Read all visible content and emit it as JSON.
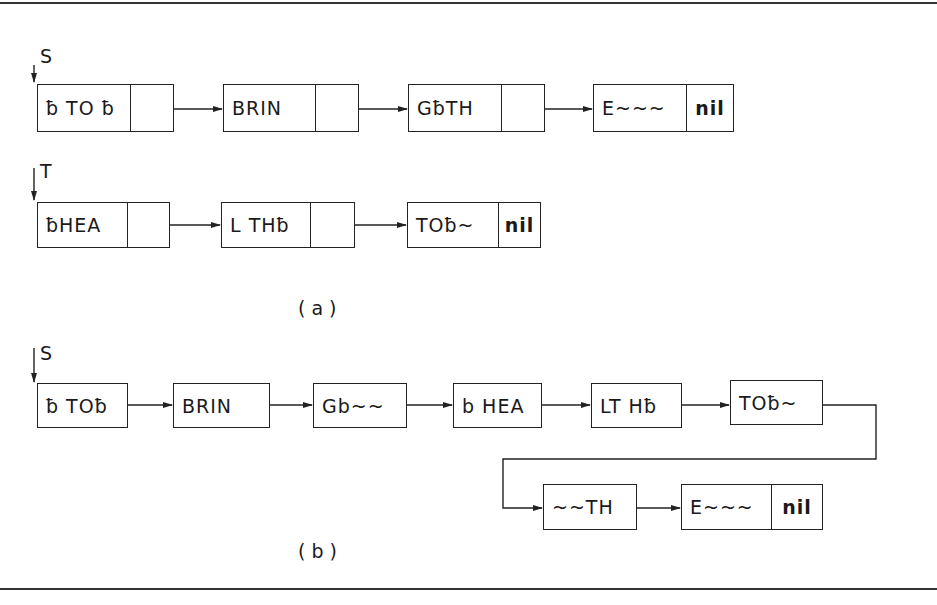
{
  "figure": {
    "part_a": {
      "caption": "(a)",
      "lists": [
        {
          "pointer_label": "S",
          "nodes": [
            {
              "data": "ƀ TO ƀ",
              "next": "pointer"
            },
            {
              "data": "BRIN",
              "next": "pointer"
            },
            {
              "data": "GƀTH",
              "next": "pointer"
            },
            {
              "data": "E~~~",
              "next": "nil"
            }
          ]
        },
        {
          "pointer_label": "T",
          "nodes": [
            {
              "data": "ƀHEA",
              "next": "pointer"
            },
            {
              "data": "L THƀ",
              "next": "pointer"
            },
            {
              "data": "TOƀ~",
              "next": "nil"
            }
          ]
        }
      ]
    },
    "part_b": {
      "caption": "(b)",
      "pointer_label": "S",
      "nodes": [
        {
          "data": "ƀ TOƀ"
        },
        {
          "data": "BRIN"
        },
        {
          "data": "Gb~~"
        },
        {
          "data": "b HEA"
        },
        {
          "data": "LT Hƀ"
        },
        {
          "data": "TOƀ~"
        },
        {
          "data": "~~TH"
        },
        {
          "data": "E~~~",
          "next": "nil"
        }
      ]
    },
    "nil_label": "nil"
  }
}
